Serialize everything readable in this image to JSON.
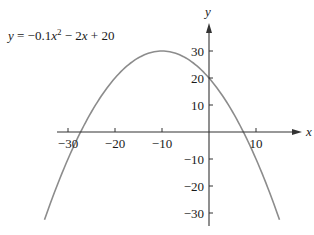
{
  "chart_data": {
    "type": "line",
    "title": "",
    "equation_label": "y = −0.1x² − 2x + 20",
    "function": {
      "a": -0.1,
      "b": -2,
      "c": 20
    },
    "xlabel": "x",
    "ylabel": "y",
    "xlim": [
      -32,
      20
    ],
    "ylim": [
      -35,
      38
    ],
    "x_ticks": [
      -30,
      -20,
      -10,
      10
    ],
    "x_tick_labels": [
      "−30",
      "−20",
      "−10",
      "10"
    ],
    "y_ticks": [
      30,
      20,
      10,
      -10,
      -20,
      -30
    ],
    "y_tick_labels": [
      "30",
      "20",
      "10",
      "−10",
      "−20",
      "−30"
    ],
    "curve_y_range": [
      -32.5,
      30
    ],
    "vertex": [
      -10,
      30
    ],
    "roots": [
      -27.32,
      7.32
    ],
    "y_intercept": 20,
    "grid": false,
    "legend": "none",
    "colors": {
      "curve": "#8c8c8c",
      "axis": "#333333",
      "text": "#1a1a1a"
    }
  }
}
